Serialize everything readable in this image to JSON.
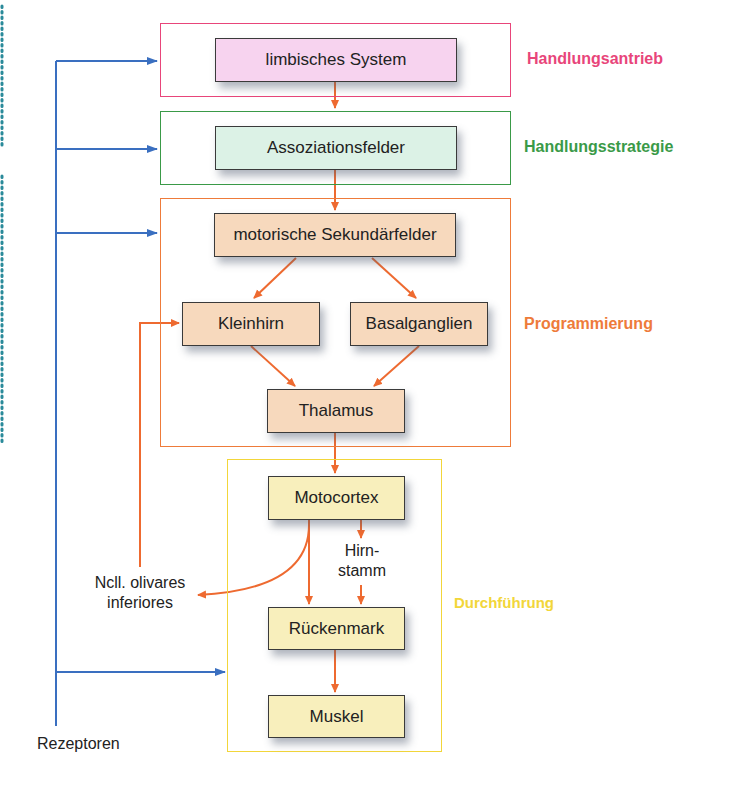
{
  "colors": {
    "antrieb": "#e8457a",
    "strategie": "#3a9a48",
    "programmierung": "#ee7b3a",
    "durchfuehrung": "#f2d63a",
    "receptor_line": "#3a6fc0",
    "arrow": "#ee6a30",
    "dots": "#2a8a9a"
  },
  "groups": {
    "antrieb": "Handlungsantrieb",
    "strategie": "Handlungsstrategie",
    "programmierung": "Programmierung",
    "durchfuehrung": "Durchführung"
  },
  "boxes": {
    "limbisch": "limbisches System",
    "assoziation": "Assoziationsfelder",
    "sekundaer": "motorische Sekundärfelder",
    "kleinhirn": "Kleinhirn",
    "basal": "Basalganglien",
    "thalamus": "Thalamus",
    "motocortex": "Motocortex",
    "rueckenmark": "Rückenmark",
    "muskel": "Muskel"
  },
  "labels": {
    "hirnstamm_1": "Hirn-",
    "hirnstamm_2": "stamm",
    "olivares_1": "Ncll. olivares",
    "olivares_2": "inferiores",
    "rezeptoren": "Rezeptoren"
  }
}
